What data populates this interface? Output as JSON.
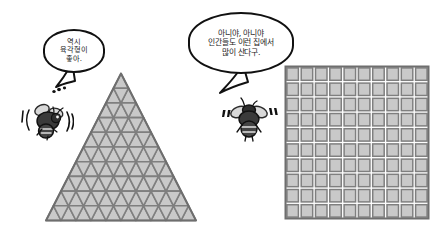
{
  "scene": {
    "title": "Bees comparing tessellation shapes",
    "background_color": "#ffffff"
  },
  "palette": {
    "ink": "#111111",
    "cell_fill": "#c9c9c9",
    "cell_line": "#7f7f7f",
    "figure_outline": "#6e6e6e",
    "bee_body": "#3a3a3a",
    "bee_wing": "#d8d8d8"
  },
  "speech_bubbles": [
    {
      "id": "bubble-left",
      "speaker": "bee-left",
      "lines": [
        "역시",
        "육각형이",
        "좋아."
      ],
      "tail_direction": "down-left",
      "has_thought_dots": true
    },
    {
      "id": "bubble-right",
      "speaker": "bee-right",
      "lines": [
        "아니야, 아니야",
        "인간들도 이런 집에서",
        "많이 산다구."
      ],
      "tail_direction": "down-left",
      "has_thought_dots": false
    }
  ],
  "characters": [
    {
      "id": "bee-left",
      "label": "bee",
      "motion_marks": "( )",
      "pose": "flying-left"
    },
    {
      "id": "bee-right",
      "label": "bee",
      "motion_marks": "« »",
      "pose": "flying-right"
    }
  ],
  "figures": [
    {
      "id": "triangle-tessellation",
      "shape": "triangle",
      "label": "triangular grid",
      "rows": 10,
      "unit_shape": "equilateral-triangle",
      "fill": "#c9c9c9",
      "line": "#7f7f7f"
    },
    {
      "id": "square-tessellation",
      "shape": "square",
      "label": "square grid",
      "rows": 10,
      "columns": 10,
      "unit_shape": "square",
      "fill": "#c9c9c9",
      "line": "#7f7f7f"
    }
  ]
}
